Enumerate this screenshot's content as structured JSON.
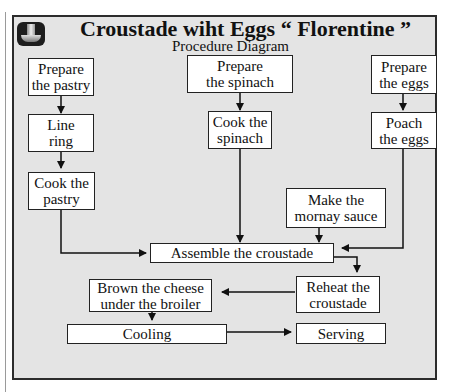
{
  "header": {
    "icon": "cooking-pot-icon",
    "title": "Croustade wiht Eggs “ Florentine ”",
    "subtitle": "Procedure Diagram"
  },
  "nodes": {
    "prepare_pastry": "Prepare\nthe pastry",
    "line_ring": "Line\nring",
    "cook_pastry": "Cook the\npastry",
    "prepare_spinach": "Prepare\nthe spinach",
    "cook_spinach": "Cook the\nspinach",
    "prepare_eggs": "Prepare\nthe eggs",
    "poach_eggs": "Poach\nthe eggs",
    "mornay_sauce": "Make the\nmornay sauce",
    "assemble": "Assemble the croustade",
    "reheat": "Reheat the\ncroustade",
    "brown_cheese": "Brown the cheese\nunder the broiler",
    "cooling": "Cooling",
    "serving": "Serving"
  },
  "edges": [
    [
      "prepare_pastry",
      "line_ring"
    ],
    [
      "line_ring",
      "cook_pastry"
    ],
    [
      "cook_pastry",
      "assemble"
    ],
    [
      "prepare_spinach",
      "cook_spinach"
    ],
    [
      "cook_spinach",
      "assemble"
    ],
    [
      "prepare_eggs",
      "poach_eggs"
    ],
    [
      "poach_eggs",
      "assemble"
    ],
    [
      "mornay_sauce",
      "assemble"
    ],
    [
      "assemble",
      "reheat"
    ],
    [
      "reheat",
      "brown_cheese"
    ],
    [
      "brown_cheese",
      "cooling"
    ],
    [
      "cooling",
      "serving"
    ]
  ]
}
